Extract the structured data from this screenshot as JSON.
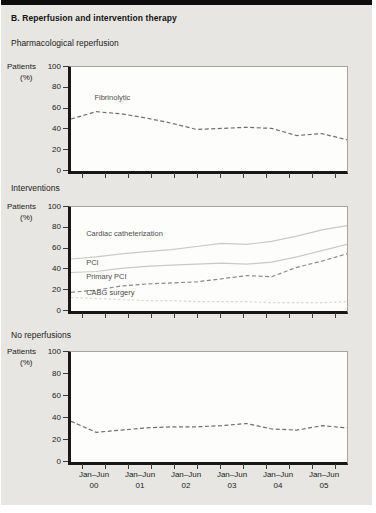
{
  "header": {
    "title": "B. Reperfusion and intervention therapy"
  },
  "y_axis": {
    "label": "Patients",
    "unit": "(%)",
    "ticks": [
      100,
      80,
      60,
      40,
      20,
      0
    ],
    "ylim": [
      0,
      100
    ]
  },
  "x_axis": {
    "tick_count": 12,
    "labels": [
      {
        "period": "Jan–Jun",
        "year": "00"
      },
      {
        "period": "Jan–Jun",
        "year": "01"
      },
      {
        "period": "Jan–Jun",
        "year": "02"
      },
      {
        "period": "Jan–Jun",
        "year": "03"
      },
      {
        "period": "Jan–Jun",
        "year": "04"
      },
      {
        "period": "Jan–Jun",
        "year": "05"
      }
    ]
  },
  "chart_data": [
    {
      "type": "line",
      "title": "Pharmacological reperfusion",
      "ylabel": "Patients (%)",
      "ylim": [
        0,
        100
      ],
      "grid": false,
      "legend": "inline-labels",
      "categories": [
        "Jan–Jun 00",
        "Jan–Jun 01",
        "Jan–Jun 02",
        "Jan–Jun 03",
        "Jan–Jun 04",
        "Jan–Jun 05"
      ],
      "points_per_category": 2,
      "series": [
        {
          "name": "Fibrinolytic",
          "style": "dashed",
          "color": "#6f6f6f",
          "show_label": true,
          "label_x": 0.085,
          "label_value": 66,
          "values": [
            50,
            57,
            55,
            51,
            46,
            40,
            41,
            42,
            41,
            34,
            36,
            30
          ]
        }
      ]
    },
    {
      "type": "line",
      "title": "Interventions",
      "ylabel": "Patients (%)",
      "ylim": [
        0,
        100
      ],
      "grid": false,
      "legend": "inline-labels",
      "categories": [
        "Jan–Jun 00",
        "Jan–Jun 01",
        "Jan–Jun 02",
        "Jan–Jun 03",
        "Jan–Jun 04",
        "Jan–Jun 05"
      ],
      "points_per_category": 2,
      "series": [
        {
          "name": "Cardiac catheterization",
          "style": "solid",
          "color": "#c9c9c6",
          "show_label": true,
          "label_x": 0.055,
          "label_value": 70,
          "values": [
            50,
            52,
            55,
            57,
            59,
            62,
            65,
            64,
            67,
            72,
            78,
            82
          ]
        },
        {
          "name": "PCI",
          "style": "solid",
          "color": "#c9c9c6",
          "show_label": true,
          "label_x": 0.055,
          "label_value": 42,
          "values": [
            37,
            38,
            41,
            43,
            44,
            45,
            46,
            45,
            47,
            52,
            58,
            64
          ]
        },
        {
          "name": "Primary PCI",
          "style": "dashed",
          "color": "#8a8a8a",
          "show_label": true,
          "label_x": 0.055,
          "label_value": 29,
          "values": [
            18,
            20,
            24,
            26,
            27,
            28,
            31,
            34,
            33,
            42,
            48,
            55
          ]
        },
        {
          "name": "CABG surgery",
          "style": "dotted",
          "color": "#d8d8d5",
          "show_label": true,
          "label_x": 0.055,
          "label_value": 13,
          "values": [
            13,
            12,
            11,
            10,
            10,
            9,
            9,
            9,
            8,
            8,
            8,
            9
          ]
        }
      ]
    },
    {
      "type": "line",
      "title": "No reperfusions",
      "ylabel": "Patients (%)",
      "ylim": [
        0,
        100
      ],
      "grid": false,
      "legend": "none",
      "categories": [
        "Jan–Jun 00",
        "Jan–Jun 01",
        "Jan–Jun 02",
        "Jan–Jun 03",
        "Jan–Jun 04",
        "Jan–Jun 05"
      ],
      "points_per_category": 2,
      "series": [
        {
          "name": "No reperfusion",
          "style": "dashed",
          "color": "#6f6f6f",
          "show_label": false,
          "values": [
            37,
            27,
            29,
            31,
            32,
            32,
            33,
            35,
            30,
            29,
            33,
            31
          ]
        }
      ]
    }
  ]
}
